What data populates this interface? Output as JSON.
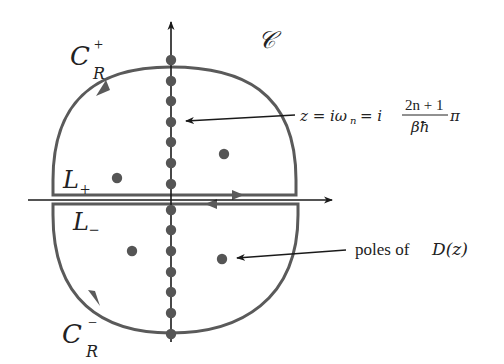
{
  "figure": {
    "colors": {
      "contour": "#5a5a5a",
      "axis": "#1a1a1a",
      "pole": "#555555",
      "text": "#222222",
      "background": "#ffffff"
    },
    "labels": {
      "contour_name": "𝒞",
      "upper_arc": {
        "main": "C",
        "sup": "+",
        "sub": "R"
      },
      "lower_arc": {
        "main": "C",
        "sub": "R",
        "sup": "−"
      },
      "upper_line": {
        "main": "L",
        "sub": "+"
      },
      "lower_line": {
        "main": "L",
        "sub": "−"
      },
      "matsubara_annotation": {
        "lhs": "z = iω",
        "lhs_sub": "n",
        "eq2": "= i",
        "numerator": "2n + 1",
        "denominator": "βħ",
        "suffix": "π"
      },
      "poles_annotation": {
        "text": "poles of ",
        "func": "D(z)"
      }
    },
    "matsubara_poles_y": [
      60,
      81,
      101,
      122,
      142,
      163,
      184,
      210,
      230,
      251,
      272,
      292,
      313,
      334
    ],
    "off_axis_poles": [
      {
        "x": 117,
        "y": 178,
        "half": "upper"
      },
      {
        "x": 224,
        "y": 154,
        "half": "upper"
      },
      {
        "x": 132,
        "y": 251,
        "half": "lower"
      },
      {
        "x": 222,
        "y": 259,
        "half": "lower"
      }
    ]
  }
}
